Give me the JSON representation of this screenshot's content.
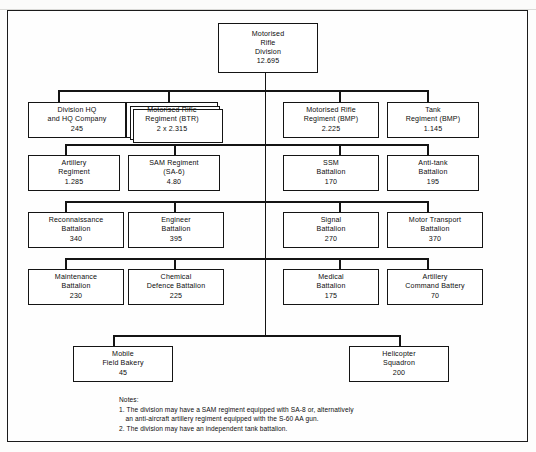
{
  "chart_title": "Motorised Rifle Division",
  "root": {
    "id": "motorised-rifle-division",
    "lines": [
      "Motorised",
      "Rifle",
      "Division",
      "12.695"
    ],
    "name": "Motorised Rifle Division",
    "strength": "12.695"
  },
  "rows": [
    {
      "row": 1,
      "nodes": [
        {
          "id": "division-hq-and-hq-company",
          "lines": [
            "Division HQ",
            "and HQ Company",
            "245"
          ],
          "strength": "245",
          "stacked": false
        },
        {
          "id": "motorised-rifle-regiment-btr",
          "lines": [
            "Motorised  Rifle",
            "Regiment (BTR)",
            "2 x 2.315"
          ],
          "strength": "2 x 2.315",
          "stacked": true
        },
        {
          "id": "motorised-rifle-regiment-bmp",
          "lines": [
            "Motorised  Rifle",
            "Regiment (BMP)",
            "2.225"
          ],
          "strength": "2.225",
          "stacked": false
        },
        {
          "id": "tank-regiment-bmp",
          "lines": [
            "Tank",
            "Regiment (BMP)",
            "1.145"
          ],
          "strength": "1.145",
          "stacked": false
        }
      ]
    },
    {
      "row": 2,
      "nodes": [
        {
          "id": "artillery-regiment",
          "lines": [
            "Artillery",
            "Regiment",
            "1.285"
          ],
          "strength": "1.285",
          "stacked": false
        },
        {
          "id": "sam-regiment-sa-6",
          "lines": [
            "SAM Regiment",
            "(SA-6)",
            "4.80"
          ],
          "strength": "4.80",
          "stacked": false
        },
        {
          "id": "ssm-battalion",
          "lines": [
            "SSM",
            "Battalion",
            "170"
          ],
          "strength": "170",
          "stacked": false
        },
        {
          "id": "anti-tank-battalion",
          "lines": [
            "Anti-tank",
            "Battalion",
            "195"
          ],
          "strength": "195",
          "stacked": false
        }
      ]
    },
    {
      "row": 3,
      "nodes": [
        {
          "id": "reconnaissance-battalion",
          "lines": [
            "Reconnaissance",
            "Battalion",
            "340"
          ],
          "strength": "340",
          "stacked": false
        },
        {
          "id": "engineer-battalion",
          "lines": [
            "Engineer",
            "Battalion",
            "395"
          ],
          "strength": "395",
          "stacked": false
        },
        {
          "id": "signal-battalion",
          "lines": [
            "Signal",
            "Battalion",
            "270"
          ],
          "strength": "270",
          "stacked": false
        },
        {
          "id": "motor-transport-battalion",
          "lines": [
            "Motor Transport",
            "Battalion",
            "370"
          ],
          "strength": "370",
          "stacked": false
        }
      ]
    },
    {
      "row": 4,
      "nodes": [
        {
          "id": "maintenance-battalion",
          "lines": [
            "Maintenance",
            "Battalion",
            "230"
          ],
          "strength": "230",
          "stacked": false
        },
        {
          "id": "chemical-defence-battalion",
          "lines": [
            "Chemical",
            "Defence Battalion",
            "225"
          ],
          "strength": "225",
          "stacked": false
        },
        {
          "id": "medical-battalion",
          "lines": [
            "Medical",
            "Battalion",
            "175"
          ],
          "strength": "175",
          "stacked": false
        },
        {
          "id": "artillery-command-battery",
          "lines": [
            "Artillery",
            "Command Battery",
            "70"
          ],
          "strength": "70",
          "stacked": false
        }
      ]
    },
    {
      "row": 5,
      "nodes": [
        {
          "id": "mobile-field-bakery",
          "lines": [
            "Mobile",
            "Field Bakery",
            "45"
          ],
          "strength": "45",
          "stacked": false
        },
        {
          "id": "helicopter-squadron",
          "lines": [
            "Helicopter",
            "Squadron",
            "200"
          ],
          "strength": "200",
          "stacked": false
        }
      ]
    }
  ],
  "notes": {
    "heading": "Notes:",
    "items": [
      {
        "num": "1.",
        "line1": "The division may have a SAM regiment equipped with SA-8 or, alternatively",
        "line2": "an anti-aircraft artillery regiment equipped with the S-60 AA gun."
      },
      {
        "num": "2.",
        "line1": "The division may have an independent tank battalion.",
        "line2": ""
      }
    ]
  }
}
